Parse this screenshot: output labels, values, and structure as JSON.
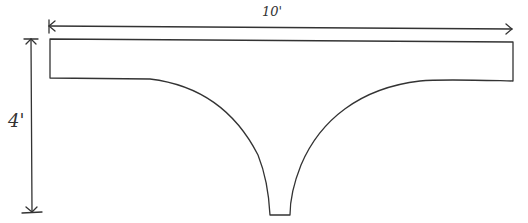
{
  "diagram": {
    "type": "hand-sketched dimensioned shape",
    "shape": "horizontal rectangular bar with concave-curved funnel tapering to a narrow flat-bottom stem",
    "dimensions": {
      "width_label": "10'",
      "height_label": "4'"
    },
    "stroke_color": "#333333",
    "background_color": "#ffffff"
  }
}
